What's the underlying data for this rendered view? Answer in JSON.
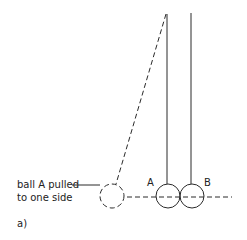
{
  "diagram": {
    "annotation": {
      "line1": "ball A pulled",
      "line2": "to one side"
    },
    "ball_a_label": "A",
    "ball_b_label": "B",
    "figure_label": "a)",
    "colors": {
      "stroke": "#2a2a2a",
      "background": "#ffffff"
    }
  }
}
